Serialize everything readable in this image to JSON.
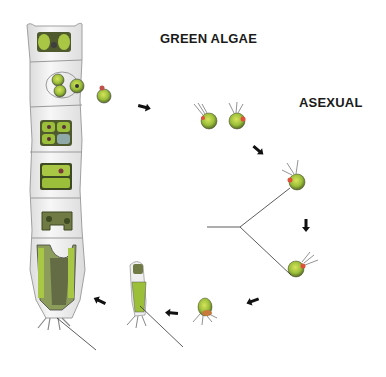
{
  "diagram": {
    "title": "GREEN ALGAE",
    "section_label": "ASEXUAL",
    "colors": {
      "cell_wall": "#efefef",
      "cell_outline": "#9a9a9a",
      "chloroplast": "#9bbf3a",
      "chloroplast_dark": "#4f5a2e",
      "eyespot": "#e0503a",
      "arrow": "#111111",
      "line": "#333333"
    },
    "stages": [
      {
        "id": "filament",
        "description": "multicellular filament with cells dividing into zoospores"
      },
      {
        "id": "zoospore-release",
        "description": "zoospore emerging from cell"
      },
      {
        "id": "free-zoospores",
        "description": "pair of flagellated zoospores"
      },
      {
        "id": "zoospore-swimming",
        "description": "single zoospore with flagella"
      },
      {
        "id": "zoospore-settling",
        "description": "zoospore with flagella pointing forward"
      },
      {
        "id": "zoospore-attached",
        "description": "zoospore with holdfast rhizoids"
      },
      {
        "id": "young-filament",
        "description": "young germling with holdfast"
      }
    ]
  }
}
